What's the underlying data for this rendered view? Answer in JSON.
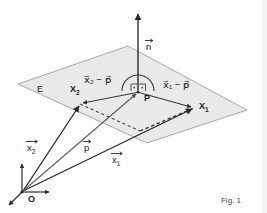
{
  "figure": {
    "caption": "Fig. 1",
    "plane_label": "E",
    "background_color": "#ffffff",
    "plane_fill_color": "#e8e8e8",
    "plane_stroke_color": "#9a9a9a",
    "vector_color": "#2b2b2b",
    "dashed_color": "#3a3a3a",
    "thin_vector_color": "#4f4f4f"
  },
  "points": {
    "origin": {
      "label": "O",
      "x": 22,
      "y": 196
    },
    "foot": {
      "label": "P",
      "x": 138,
      "y": 92
    },
    "x1": {
      "label": "X",
      "sub": "1",
      "x": 203,
      "y": 106
    },
    "x2": {
      "label": "X",
      "sub": "2",
      "x": 76,
      "y": 89
    }
  },
  "vectors": [
    {
      "name": "normal-vector",
      "base": "n",
      "has_arrow_accent": true,
      "label_x": 150,
      "label_y": 47,
      "from": [
        138,
        89
      ],
      "to": [
        138,
        12
      ]
    },
    {
      "name": "x1-minus-p-vector",
      "expression": "x⃗₁ − p⃗",
      "label_x": 164,
      "label_y": 88,
      "from": [
        138,
        92
      ],
      "to": [
        194,
        108
      ]
    },
    {
      "name": "x2-minus-p-vector",
      "expression": "x⃗₂ − p⃗",
      "label_x": 85,
      "label_y": 83,
      "from": [
        138,
        92
      ],
      "to": [
        80,
        104
      ]
    },
    {
      "name": "position-vector-x1",
      "base": "x",
      "sub": "1",
      "label_x": 113,
      "label_y": 160,
      "from": [
        22,
        192
      ],
      "to": [
        194,
        108
      ]
    },
    {
      "name": "position-vector-x2",
      "base": "x",
      "sub": "2",
      "label_x": 28,
      "label_y": 148,
      "from": [
        22,
        192
      ],
      "to": [
        80,
        104
      ]
    },
    {
      "name": "position-vector-p",
      "base": "p",
      "label_x": 85,
      "label_y": 150,
      "from": [
        22,
        192
      ],
      "to": [
        138,
        92
      ]
    }
  ],
  "plane": {
    "name": "plane-E",
    "corners": [
      [
        18,
        84
      ],
      [
        128,
        46
      ],
      [
        247,
        110
      ],
      [
        147,
        143
      ]
    ],
    "label_x": 43,
    "label_y": 89
  },
  "axes": [
    {
      "name": "axis-up",
      "from": [
        22,
        192
      ],
      "to": [
        22,
        161
      ]
    },
    {
      "name": "axis-right",
      "from": [
        22,
        192
      ],
      "to": [
        52,
        192
      ]
    },
    {
      "name": "axis-down-left",
      "from": [
        22,
        192
      ],
      "to": [
        7,
        207
      ]
    }
  ],
  "dashed_lines": [
    {
      "name": "dashed-parallel-x2",
      "from": [
        80,
        104
      ],
      "to": [
        140,
        131
      ]
    },
    {
      "name": "dashed-parallel-x1",
      "from": [
        140,
        131
      ],
      "to": [
        194,
        108
      ]
    }
  ],
  "angle_marks": {
    "arc_label": "right-angle-arc",
    "left_mark_label": "right-angle-left",
    "right_mark_label": "right-angle-right"
  }
}
